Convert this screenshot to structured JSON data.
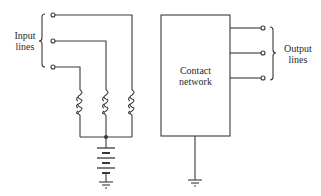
{
  "diagram": {
    "input_label": [
      "Input",
      "lines"
    ],
    "output_label": [
      "Output",
      "lines"
    ],
    "box_label": [
      "Contact",
      "network"
    ],
    "line_color": "#3a3a3a",
    "components": {
      "input_terminals": 3,
      "coils": 3,
      "battery": "battery-icon",
      "grounds": 2,
      "output_terminals": 3
    }
  }
}
